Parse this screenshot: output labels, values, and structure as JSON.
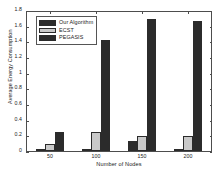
{
  "chart_data": {
    "type": "bar",
    "title": "",
    "xlabel": "Number of Nodes",
    "ylabel": "Average Energy Consumption",
    "categories": [
      "50",
      "100",
      "150",
      "200"
    ],
    "series": [
      {
        "name": "Our Algorithm",
        "color": "#2b2b2b",
        "values": [
          0.01,
          0.02,
          0.13,
          0.02
        ]
      },
      {
        "name": "ECST",
        "color": "#c9c9c9",
        "values": [
          0.09,
          0.24,
          0.2,
          0.19
        ]
      },
      {
        "name": "PEGASIS",
        "color": "#2b2b2b",
        "values": [
          0.25,
          1.44,
          1.71,
          1.68
        ]
      }
    ],
    "ylim": [
      0,
      1.8
    ],
    "ytick_labels": [
      "0",
      "0.2",
      "0.4",
      "0.6",
      "0.8",
      "1",
      "1.2",
      "1.4",
      "1.6",
      "1.8"
    ],
    "ytick_values": [
      0,
      0.2,
      0.4,
      0.6,
      0.8,
      1.0,
      1.2,
      1.4,
      1.6,
      1.8
    ],
    "xtick_labels": [
      "50",
      "100",
      "150",
      "200"
    ],
    "grid": false,
    "legend_position": "upper left",
    "legend_entries": [
      "Our Algorithm",
      "ECST",
      "PEGASIS"
    ]
  }
}
